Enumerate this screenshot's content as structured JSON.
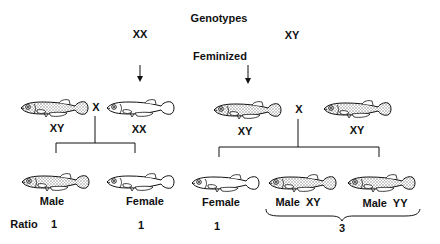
{
  "title": "Genotypes",
  "subtitle": "Feminized",
  "genotypes": {
    "left": "XX",
    "right": "XY"
  },
  "cross_symbol": "X",
  "crosses": [
    {
      "parents": [
        {
          "genotype": "XY",
          "phenotype": "male",
          "shaded": true
        },
        {
          "genotype": "XX",
          "phenotype": "feminized female",
          "shaded": false
        }
      ],
      "offspring": [
        {
          "label": "Male",
          "shaded": true
        },
        {
          "label": "Female",
          "shaded": false
        }
      ],
      "ratios": [
        "1",
        "1"
      ]
    },
    {
      "parents": [
        {
          "genotype": "XY",
          "phenotype": "feminized",
          "shaded": true
        },
        {
          "genotype": "XY",
          "phenotype": "male",
          "shaded": true
        }
      ],
      "offspring": [
        {
          "label": "Female",
          "shaded": false
        },
        {
          "label": "Male  XY",
          "shaded": true
        },
        {
          "label": "Male  YY",
          "shaded": true
        }
      ],
      "ratios": [
        "1",
        "3"
      ]
    }
  ],
  "ratio_label": "Ratio",
  "colors": {
    "ink": "#111111",
    "shading": "#c8c8c8",
    "background": "#ffffff"
  }
}
